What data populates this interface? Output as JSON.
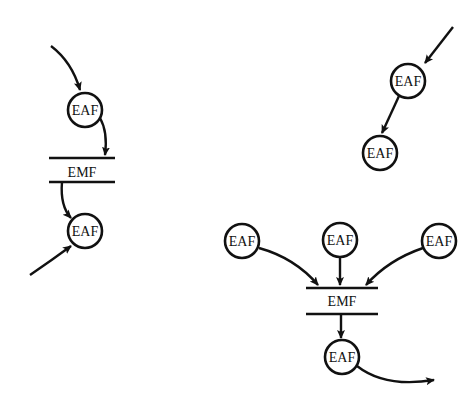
{
  "diagram": {
    "node_labels": {
      "eaf": "EAF",
      "emf": "EMF"
    },
    "groups": [
      {
        "id": "left-chain",
        "nodes": [
          "EAF",
          "EMF",
          "EAF"
        ]
      },
      {
        "id": "top-right-chain",
        "nodes": [
          "EAF",
          "EAF"
        ]
      },
      {
        "id": "bottom-right-merge",
        "nodes": [
          "EAF",
          "EAF",
          "EAF",
          "EMF",
          "EAF"
        ]
      }
    ],
    "colors": {
      "ink": "#111111",
      "background": "#ffffff"
    }
  },
  "labels": {
    "l_eaf1": "EAF",
    "l_emf": "EMF",
    "l_eaf2": "EAF",
    "tr_eaf1": "EAF",
    "tr_eaf2": "EAF",
    "br_eaf_left": "EAF",
    "br_eaf_mid": "EAF",
    "br_eaf_right": "EAF",
    "br_emf": "EMF",
    "br_eaf_out": "EAF"
  }
}
